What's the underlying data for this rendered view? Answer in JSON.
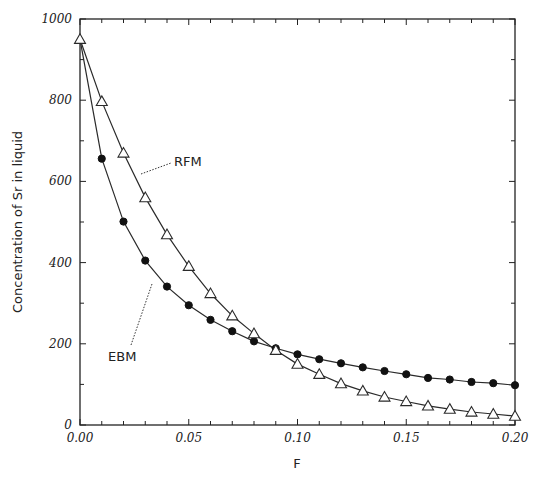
{
  "chart_data": {
    "type": "line",
    "title": "",
    "xlabel": "F",
    "ylabel": "Concentration of Sr in liquid",
    "xlim": [
      0,
      0.2
    ],
    "ylim": [
      0,
      1000
    ],
    "grid": false,
    "legend": "inline annotations with dotted leader lines",
    "x_ticks": [
      "0.00",
      "0.05",
      "0.10",
      "0.15",
      "0.20"
    ],
    "y_ticks": [
      "0",
      "200",
      "400",
      "600",
      "800",
      "1000"
    ],
    "x": [
      0.0,
      0.01,
      0.02,
      0.03,
      0.04,
      0.05,
      0.06,
      0.07,
      0.08,
      0.09,
      0.1,
      0.11,
      0.12,
      0.13,
      0.14,
      0.15,
      0.16,
      0.17,
      0.18,
      0.19,
      0.2
    ],
    "series": [
      {
        "name": "RFM",
        "marker": "open-triangle",
        "values": [
          950,
          797,
          670,
          560,
          469,
          391,
          324,
          269,
          225,
          184,
          150,
          125,
          102,
          84,
          69,
          58,
          47,
          39,
          32,
          27,
          22
        ]
      },
      {
        "name": "EBM",
        "marker": "filled-circle",
        "values": [
          950,
          656,
          501,
          405,
          341,
          295,
          259,
          231,
          206,
          189,
          174,
          162,
          152,
          142,
          133,
          125,
          116,
          112,
          106,
          103,
          98
        ]
      }
    ],
    "annotations": [
      {
        "text": "RFM",
        "target_series": "RFM"
      },
      {
        "text": "EBM",
        "target_series": "EBM"
      }
    ]
  },
  "colors": {
    "line": "#2a2a2a",
    "marker_fill_filled": "#111111",
    "marker_fill_open": "#ffffff",
    "axis": "#222222",
    "leader": "#333333"
  }
}
